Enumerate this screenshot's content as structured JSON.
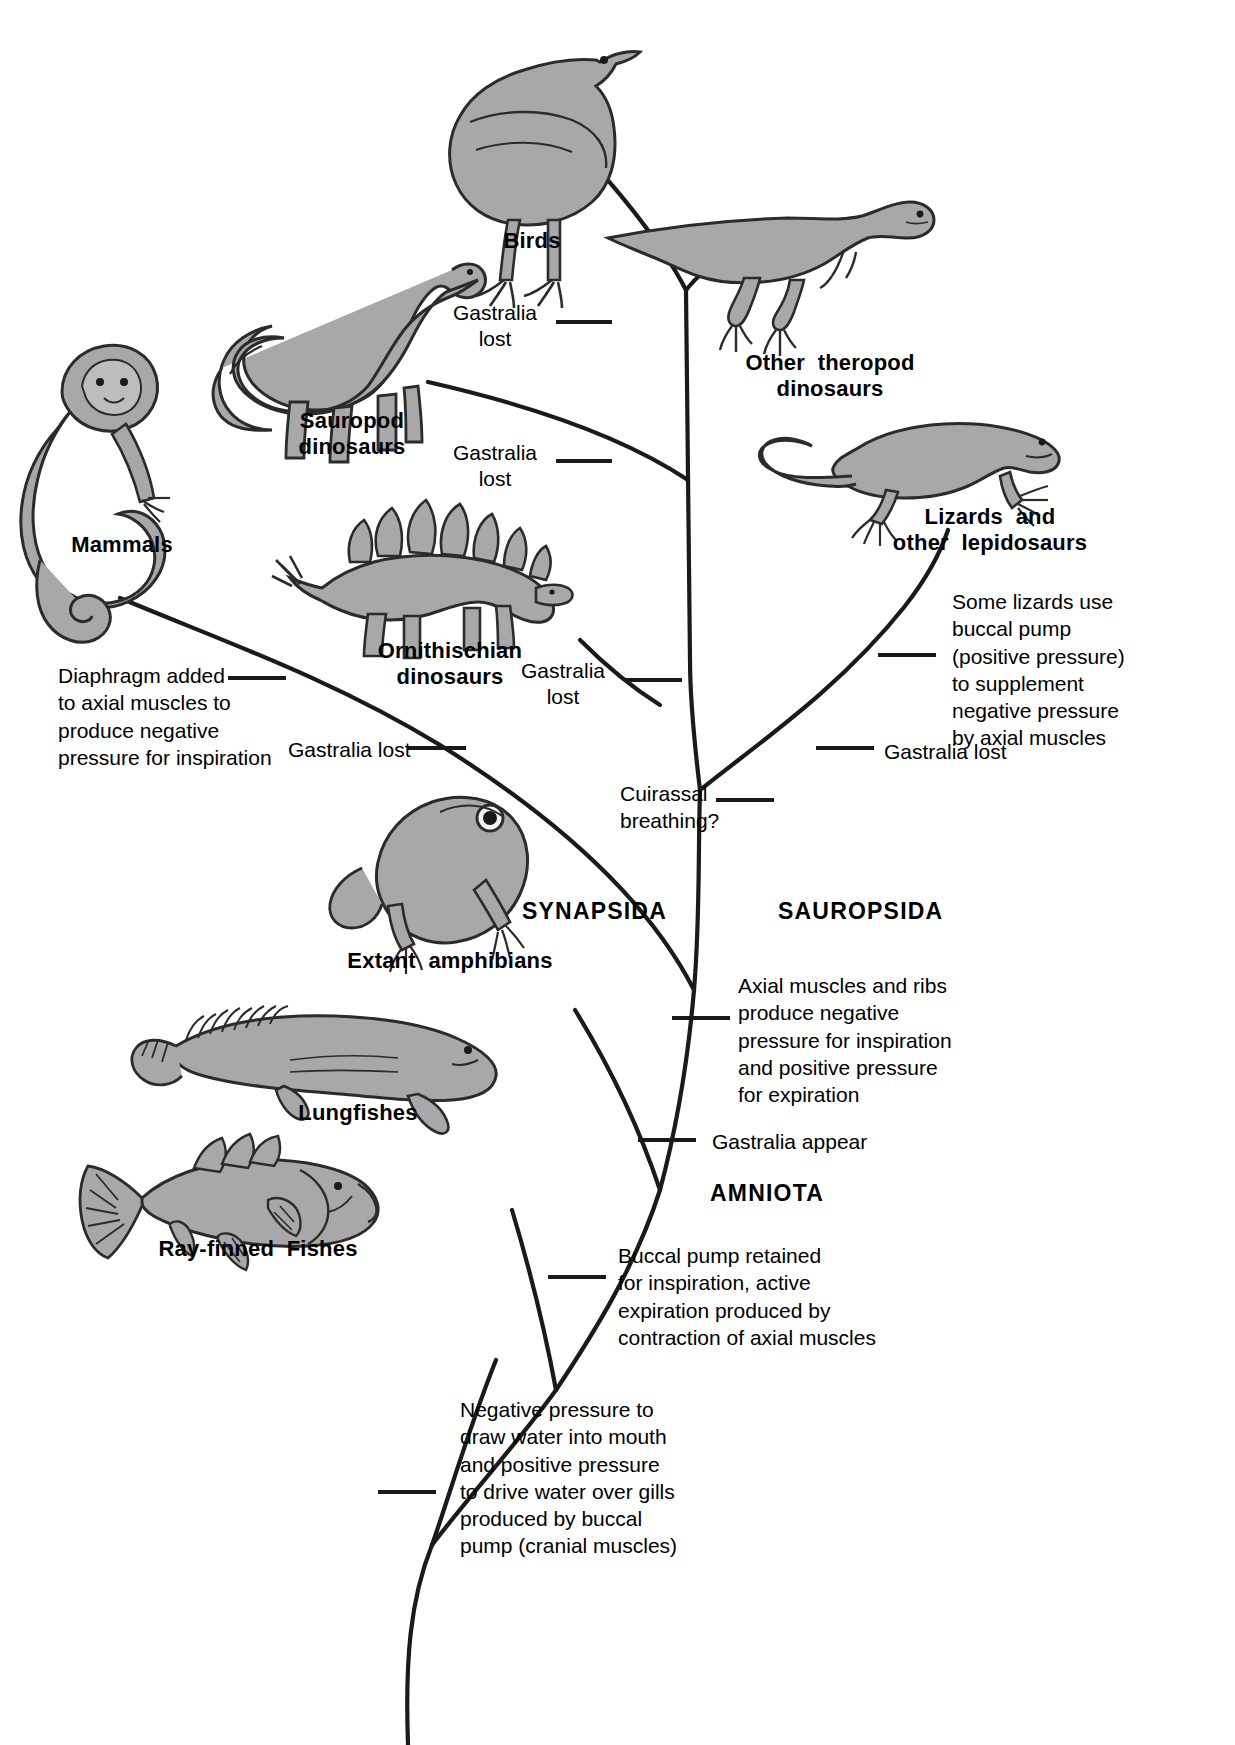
{
  "figure": {
    "type": "phylogenetic-tree",
    "background_color": "#ffffff",
    "line_color": "#1a1a1a",
    "animal_fill_color": "#a8a8a8",
    "animal_outline_color": "#2b2b2b"
  },
  "taxa": [
    {
      "id": "birds",
      "label": "Birds"
    },
    {
      "id": "other-theropod-dinosaurs",
      "label": "Other  theropod\ndinosaurs"
    },
    {
      "id": "sauropod-dinosaurs",
      "label": "Sauropod\ndinosaurs"
    },
    {
      "id": "ornithischian-dinosaurs",
      "label": "Ornithischian\ndinosaurs"
    },
    {
      "id": "lizards-and-other-lepidosaurs",
      "label": "Lizards  and\nother  lepidosaurs"
    },
    {
      "id": "mammals",
      "label": "Mammals"
    },
    {
      "id": "extant-amphibians",
      "label": "Extant  amphibians"
    },
    {
      "id": "lungfishes",
      "label": "Lungfishes"
    },
    {
      "id": "ray-finned-fishes",
      "label": "Ray-finned  Fishes"
    }
  ],
  "clades": [
    {
      "id": "synapsida",
      "label": "SYNAPSIDA"
    },
    {
      "id": "sauropsida",
      "label": "SAUROPSIDA"
    },
    {
      "id": "amniota",
      "label": "AMNIOTA"
    }
  ],
  "annotations": [
    {
      "id": "gastralia-lost-birds",
      "label": "Gastralia\nlost"
    },
    {
      "id": "gastralia-lost-sauropod",
      "label": "Gastralia\nlost"
    },
    {
      "id": "gastralia-lost-ornithischian",
      "label": "Gastralia\nlost"
    },
    {
      "id": "gastralia-lost-mammals",
      "label": "Gastralia lost"
    },
    {
      "id": "gastralia-lost-lepidosaurs",
      "label": "Gastralia lost"
    },
    {
      "id": "gastralia-appear",
      "label": "Gastralia appear"
    },
    {
      "id": "cuirassal-breathing",
      "label": "Cuirassal\nbreathing?"
    },
    {
      "id": "diaphragm-added",
      "label": "Diaphragm added\nto axial muscles to\nproduce negative\npressure for inspiration"
    },
    {
      "id": "some-lizards-buccal-pump",
      "label": "Some lizards use\nbuccal pump\n(positive pressure)\nto supplement\nnegative pressure\nby axial muscles"
    },
    {
      "id": "axial-muscles-and-ribs",
      "label": "Axial muscles and ribs\nproduce negative\npressure for inspiration\nand positive pressure\nfor expiration"
    },
    {
      "id": "buccal-pump-retained",
      "label": "Buccal pump retained\nfor inspiration, active\nexpiration produced by\ncontraction of axial muscles"
    },
    {
      "id": "negative-pressure-water",
      "label": "Negative pressure to\ndraw water into mouth\nand positive pressure\nto drive water over gills\nproduced by buccal\npump (cranial muscles)"
    }
  ]
}
